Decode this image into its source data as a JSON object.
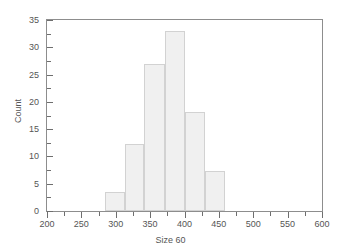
{
  "chart_data": {
    "type": "bar",
    "title": "",
    "subtitle": "",
    "xlabel": "Size 60",
    "ylabel": "Count",
    "xlim": [
      200,
      600
    ],
    "ylim": [
      0,
      35
    ],
    "grid": false,
    "legend": null,
    "x_ticks_major": [
      200,
      250,
      300,
      350,
      400,
      450,
      500,
      550,
      600
    ],
    "x_ticks_minor": [
      225,
      275,
      325,
      375,
      425,
      475,
      525,
      575
    ],
    "y_ticks_major": [
      0,
      5,
      10,
      15,
      20,
      25,
      30,
      35
    ],
    "y_ticks_minor": [
      2.5,
      7.5,
      12.5,
      17.5,
      22.5,
      27.5,
      32.5
    ],
    "x_tick_labels": [
      "200",
      "250",
      "300",
      "350",
      "400",
      "450",
      "500",
      "550",
      "600"
    ],
    "y_tick_labels": [
      "0",
      "5",
      "10",
      "15",
      "20",
      "25",
      "30",
      "35"
    ],
    "bin_edges": [
      285,
      313,
      341,
      371,
      400,
      430,
      459
    ],
    "categories": [
      "285-313",
      "313-341",
      "341-371",
      "371-400",
      "400-430",
      "430-459"
    ],
    "values": [
      3.4,
      12.3,
      27.0,
      33.0,
      18.2,
      7.4
    ],
    "bar_fill_color": "#f0f0f0",
    "bar_edge_color": "#d2d2d2",
    "axis_color": "#8d8d8d",
    "text_color": "#555555"
  },
  "axes": {
    "x_title": "Size 60",
    "y_title": "Count"
  }
}
